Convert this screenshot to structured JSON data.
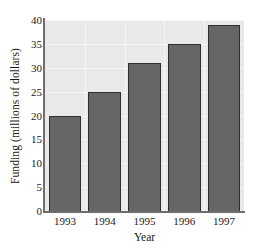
{
  "chart_data": {
    "type": "bar",
    "title": "",
    "xlabel": "Year",
    "ylabel": "Funding (millions of dollars)",
    "categories": [
      "1993",
      "1994",
      "1995",
      "1996",
      "1997"
    ],
    "values": [
      20,
      25,
      31,
      35,
      39
    ],
    "ylim": [
      0,
      40
    ],
    "yticks": [
      "0",
      "5",
      "10",
      "15",
      "20",
      "25",
      "30",
      "35",
      "40"
    ],
    "ytick_values": [
      0,
      5,
      10,
      15,
      20,
      25,
      30,
      35,
      40
    ],
    "grid": true,
    "legend": "none",
    "colors": {
      "bar_fill": "#666666",
      "bar_edge": "#2f2f2f",
      "plot_background": "#e9e9e9",
      "grid_line": "#f4f4f4",
      "axis_line": "#6e6e6e",
      "text": "#1a1a1a",
      "figure_background": "#ffffff"
    }
  }
}
